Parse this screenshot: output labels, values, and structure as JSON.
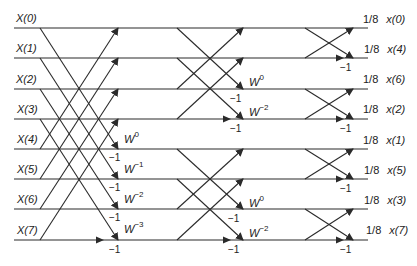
{
  "diagram": {
    "colors": {
      "line": "#2a2a2a",
      "text": "#222222",
      "background": "#ffffff"
    },
    "inputs": [
      "X(0)",
      "X(1)",
      "X(2)",
      "X(3)",
      "X(4)",
      "X(5)",
      "X(6)",
      "X(7)"
    ],
    "outputs": [
      {
        "scale": "1/8",
        "label": "x(0)"
      },
      {
        "scale": "1/8",
        "label": "x(4)"
      },
      {
        "scale": "1/8",
        "label": "x(6)"
      },
      {
        "scale": "1/8",
        "label": "x(2)"
      },
      {
        "scale": "1/8",
        "label": "x(1)"
      },
      {
        "scale": "1/8",
        "label": "x(5)"
      },
      {
        "scale": "1/8",
        "label": "x(3)"
      },
      {
        "scale": "1/8",
        "label": "x(7)"
      }
    ],
    "stage1": {
      "twiddles": [
        {
          "base": "W",
          "exp": "0"
        },
        {
          "base": "W",
          "exp": "−1"
        },
        {
          "base": "W",
          "exp": "−2"
        },
        {
          "base": "W",
          "exp": "−3"
        }
      ],
      "neg_label": "−1"
    },
    "stage2": {
      "twiddles": [
        {
          "base": "W",
          "exp": "0"
        },
        {
          "base": "W",
          "exp": "−2"
        },
        {
          "base": "W",
          "exp": "0"
        },
        {
          "base": "W",
          "exp": "−2"
        }
      ],
      "neg_label": "−1"
    },
    "stage3": {
      "neg_label": "−1"
    }
  }
}
